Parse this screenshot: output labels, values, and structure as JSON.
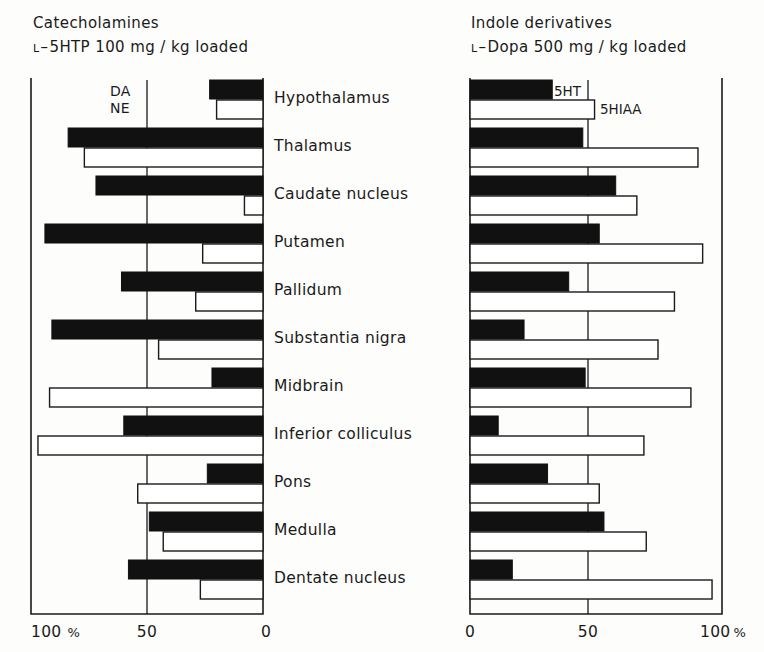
{
  "panels": {
    "left": {
      "title": "Catecholamines",
      "subtitle_prefix": "L",
      "subtitle_dash": "–",
      "subtitle": "5HTP  100 mg / kg  loaded",
      "series": [
        {
          "key": "DA",
          "label": "DA",
          "style": "filled"
        },
        {
          "key": "NE",
          "label": "NE",
          "style": "open"
        }
      ],
      "axis": {
        "direction": "right-to-left",
        "ticks": [
          {
            "value": 100,
            "label": "100",
            "suffix": "%"
          },
          {
            "value": 50,
            "label": "50",
            "suffix": ""
          },
          {
            "value": 0,
            "label": "0",
            "suffix": ""
          }
        ],
        "max": 100,
        "gridline_at": 50
      }
    },
    "right": {
      "title": "Indole  derivatives",
      "subtitle_prefix": "L",
      "subtitle_dash": "–",
      "subtitle": "Dopa   500 mg / kg loaded",
      "series": [
        {
          "key": "5HT",
          "label": "5HT",
          "style": "filled"
        },
        {
          "key": "5HIAA",
          "label": "5HIAA",
          "style": "open"
        }
      ],
      "axis": {
        "direction": "left-to-right",
        "ticks": [
          {
            "value": 0,
            "label": "0",
            "suffix": ""
          },
          {
            "value": 50,
            "label": "50",
            "suffix": ""
          },
          {
            "value": 100,
            "label": "100",
            "suffix": "%"
          }
        ],
        "max": 100,
        "gridline_at": 50
      }
    }
  },
  "regions": [
    "Hypothalamus",
    "Thalamus",
    "Caudate nucleus",
    "Putamen",
    "Pallidum",
    "Substantia nigra",
    "Midbrain",
    "Inferior colliculus",
    "Pons",
    "Medulla",
    "Dentate nucleus"
  ],
  "chart_data": {
    "type": "bar",
    "orientation": "horizontal",
    "layout": "back-to-back paired panels, shared category axis in centre",
    "categories": [
      "Hypothalamus",
      "Thalamus",
      "Caudate nucleus",
      "Putamen",
      "Pallidum",
      "Substantia nigra",
      "Midbrain",
      "Inferior colliculus",
      "Pons",
      "Medulla",
      "Dentate nucleus"
    ],
    "xlabel": "%",
    "ylabel": "",
    "xlim": [
      0,
      100
    ],
    "grid": true,
    "gridlines": [
      50
    ],
    "legend": [
      "DA",
      "NE",
      "5HT",
      "5HIAA"
    ],
    "legend_position": "top of each panel, at first category row",
    "panels": [
      {
        "name": "Catecholamines",
        "annotation": "L–5HTP 100 mg / kg loaded",
        "axis_ticks": [
          100,
          50,
          0
        ],
        "axis_direction": "decreasing left to right",
        "series": [
          {
            "name": "DA",
            "fill": "solid-black",
            "values": [
              23,
              84,
              72,
              94,
              61,
              91,
              22,
              60,
              24,
              49,
              58
            ]
          },
          {
            "name": "NE",
            "fill": "open-white",
            "values": [
              20,
              77,
              8,
              26,
              29,
              45,
              92,
              97,
              54,
              43,
              27
            ]
          }
        ]
      },
      {
        "name": "Indole derivatives",
        "annotation": "L–Dopa 500 mg / kg loaded",
        "axis_ticks": [
          0,
          50,
          100
        ],
        "axis_direction": "increasing left to right",
        "series": [
          {
            "name": "5HT",
            "fill": "solid-black",
            "values": [
              35,
              48,
              62,
              55,
              42,
              23,
              49,
              12,
              33,
              57,
              18
            ]
          },
          {
            "name": "5HIAA",
            "fill": "open-white",
            "values": [
              53,
              97,
              71,
              99,
              87,
              80,
              94,
              74,
              55,
              75,
              103
            ]
          }
        ]
      }
    ]
  }
}
